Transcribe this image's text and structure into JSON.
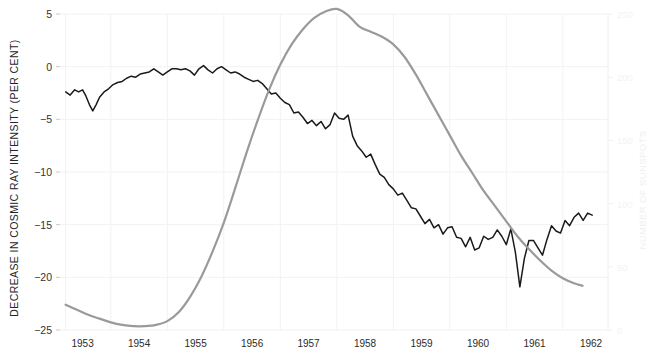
{
  "chart_data": {
    "type": "line",
    "title": "",
    "subtitle": "",
    "xlabel": "",
    "ylabel": "DECREASE IN COSMIC RAY INTENSITY (PER CENT)",
    "y2label": "NUMBER OF SUNSPOTS",
    "grid": true,
    "legend_position": "none",
    "xlim": [
      1952.6,
      1962.3
    ],
    "ylim": [
      -25,
      5
    ],
    "y2lim": [
      0,
      250
    ],
    "x_tick_labels": [
      "1953",
      "1954",
      "1955",
      "1956",
      "1957",
      "1958",
      "1959",
      "1960",
      "1961",
      "1962"
    ],
    "x_ticks": [
      1953,
      1954,
      1955,
      1956,
      1957,
      1958,
      1959,
      1960,
      1961,
      1962
    ],
    "y_tick_labels": [
      "5",
      "0",
      "-5",
      "-10",
      "-15",
      "-20",
      "-25"
    ],
    "y_ticks": [
      5,
      0,
      -5,
      -10,
      -15,
      -20,
      -25
    ],
    "y2_tick_labels": [
      "250",
      "200",
      "150",
      "100",
      "50",
      "0"
    ],
    "y2_ticks": [
      250,
      200,
      150,
      100,
      50,
      0
    ],
    "colors": {
      "cosmic_ray_line": "#1a1a1a",
      "sunspot_line": "#9a9a9a",
      "grid": "#f2f2f2",
      "background": "#ffffff"
    },
    "series": [
      {
        "name": "Decrease in cosmic ray intensity (per cent)",
        "axis": "left",
        "color": "#1a1a1a",
        "x": [
          1952.7,
          1952.78,
          1952.86,
          1952.93,
          1953.0,
          1953.06,
          1953.12,
          1953.18,
          1953.24,
          1953.3,
          1953.38,
          1953.46,
          1953.54,
          1953.62,
          1953.7,
          1953.78,
          1953.86,
          1953.94,
          1954.02,
          1954.1,
          1954.18,
          1954.26,
          1954.34,
          1954.42,
          1954.5,
          1954.58,
          1954.66,
          1954.74,
          1954.82,
          1954.9,
          1954.98,
          1955.06,
          1955.14,
          1955.22,
          1955.3,
          1955.38,
          1955.46,
          1955.54,
          1955.62,
          1955.7,
          1955.78,
          1955.86,
          1955.94,
          1956.02,
          1956.1,
          1956.18,
          1956.26,
          1956.34,
          1956.42,
          1956.5,
          1956.58,
          1956.66,
          1956.74,
          1956.82,
          1956.9,
          1956.98,
          1957.06,
          1957.14,
          1957.22,
          1957.3,
          1957.38,
          1957.46,
          1957.54,
          1957.62,
          1957.7,
          1957.78,
          1957.86,
          1957.94,
          1958.02,
          1958.1,
          1958.18,
          1958.26,
          1958.34,
          1958.42,
          1958.5,
          1958.58,
          1958.66,
          1958.74,
          1958.82,
          1958.9,
          1958.98,
          1959.06,
          1959.14,
          1959.22,
          1959.3,
          1959.38,
          1959.46,
          1959.54,
          1959.62,
          1959.7,
          1959.78,
          1959.86,
          1959.94,
          1960.02,
          1960.1,
          1960.18,
          1960.26,
          1960.34,
          1960.42,
          1960.5,
          1960.58,
          1960.66,
          1960.74,
          1960.82,
          1960.9,
          1960.98,
          1961.06,
          1961.14,
          1961.22,
          1961.3,
          1961.38,
          1961.46,
          1961.54,
          1961.62,
          1961.7,
          1961.78,
          1961.86,
          1961.94,
          1962.02
        ],
        "y": [
          -2.4,
          -2.7,
          -2.2,
          -2.4,
          -2.2,
          -2.8,
          -3.6,
          -4.2,
          -3.6,
          -2.9,
          -2.4,
          -2.1,
          -1.7,
          -1.5,
          -1.4,
          -1.1,
          -0.9,
          -1.0,
          -0.7,
          -0.6,
          -0.5,
          -0.2,
          -0.5,
          -0.8,
          -0.5,
          -0.2,
          -0.2,
          -0.3,
          -0.2,
          -0.4,
          -0.8,
          -0.2,
          0.1,
          -0.3,
          -0.6,
          -0.2,
          0.0,
          -0.3,
          -0.6,
          -0.5,
          -0.7,
          -1.0,
          -1.2,
          -1.4,
          -1.3,
          -1.6,
          -2.1,
          -2.6,
          -2.5,
          -3.0,
          -3.4,
          -3.6,
          -4.4,
          -4.3,
          -4.8,
          -5.4,
          -5.1,
          -5.6,
          -5.2,
          -5.9,
          -5.5,
          -4.4,
          -4.9,
          -5.0,
          -4.6,
          -6.6,
          -7.5,
          -8.0,
          -8.6,
          -8.3,
          -9.3,
          -10.2,
          -10.5,
          -11.2,
          -11.6,
          -12.2,
          -12.0,
          -12.7,
          -13.4,
          -13.5,
          -14.2,
          -14.9,
          -14.5,
          -15.3,
          -15.0,
          -15.9,
          -15.3,
          -15.2,
          -16.2,
          -16.3,
          -17.1,
          -16.2,
          -17.4,
          -17.2,
          -16.1,
          -16.4,
          -16.2,
          -15.5,
          -16.1,
          -16.9,
          -15.4,
          -17.6,
          -20.9,
          -18.2,
          -16.5,
          -16.5,
          -17.2,
          -17.9,
          -16.4,
          -15.1,
          -15.6,
          -15.8,
          -14.6,
          -15.1,
          -14.3,
          -13.9,
          -14.6,
          -13.9,
          -14.1
        ],
        "note": "Monthly-ish ragged trace digitised from plot"
      },
      {
        "name": "Number of sunspots",
        "axis": "right",
        "color": "#9a9a9a",
        "x": [
          1952.7,
          1952.9,
          1953.1,
          1953.3,
          1953.5,
          1953.7,
          1953.9,
          1954.1,
          1954.3,
          1954.5,
          1954.7,
          1954.9,
          1955.1,
          1955.3,
          1955.5,
          1955.7,
          1955.9,
          1956.1,
          1956.3,
          1956.5,
          1956.7,
          1956.9,
          1957.1,
          1957.3,
          1957.5,
          1957.7,
          1957.9,
          1958.1,
          1958.3,
          1958.5,
          1958.7,
          1958.9,
          1959.1,
          1959.3,
          1959.5,
          1959.7,
          1959.9,
          1960.1,
          1960.3,
          1960.5,
          1960.7,
          1960.9,
          1961.1,
          1961.3,
          1961.5,
          1961.7,
          1961.85
        ],
        "y": [
          20,
          16,
          12,
          9,
          6,
          4,
          3,
          3,
          4,
          7,
          14,
          26,
          42,
          62,
          85,
          112,
          140,
          166,
          190,
          210,
          226,
          238,
          247,
          252,
          254,
          249,
          240,
          236,
          232,
          226,
          216,
          202,
          186,
          170,
          154,
          138,
          124,
          110,
          98,
          86,
          74,
          64,
          55,
          47,
          41,
          37,
          35
        ],
        "note": "Smoothed sunspot number envelope, right axis"
      }
    ]
  },
  "axes": {
    "left_title": "DECREASE IN COSMIC RAY INTENSITY (PER CENT)",
    "right_title": "NUMBER OF SUNSPOTS"
  }
}
